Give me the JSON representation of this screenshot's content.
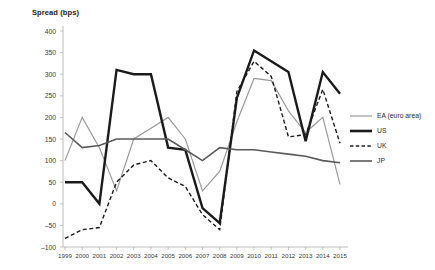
{
  "chart_data": {
    "type": "line",
    "title": "Spread (bps)",
    "xlabel": "",
    "ylabel": "Spread (bps)",
    "ylim": [
      -100,
      400
    ],
    "ytick_step": 50,
    "yticks": [
      400,
      350,
      300,
      250,
      200,
      150,
      100,
      50,
      0,
      -50,
      -100
    ],
    "grid": false,
    "legend_position": "right",
    "x": [
      1999,
      2000,
      2001,
      2002,
      2003,
      2004,
      2005,
      2006,
      2007,
      2008,
      2009,
      2010,
      2011,
      2012,
      2013,
      2014,
      2015
    ],
    "categories": [
      "1999",
      "2000",
      "2001",
      "2002",
      "2003",
      "2004",
      "2005",
      "2006",
      "2007",
      "2008",
      "2009",
      "2010",
      "2011",
      "2012",
      "2013",
      "2014",
      "2015"
    ],
    "series": [
      {
        "name": "EA (euro area)",
        "color": "#9a9a9a",
        "style": "solid",
        "width": 1.2,
        "values": [
          100,
          200,
          130,
          30,
          150,
          175,
          200,
          150,
          30,
          75,
          190,
          290,
          285,
          215,
          165,
          200,
          45
        ]
      },
      {
        "name": "US",
        "color": "#1a1a1a",
        "style": "solid",
        "width": 2.4,
        "values": [
          50,
          50,
          0,
          310,
          300,
          300,
          130,
          125,
          -10,
          -45,
          245,
          355,
          330,
          305,
          145,
          305,
          255
        ]
      },
      {
        "name": "UK",
        "color": "#1a1a1a",
        "style": "dashed",
        "width": 1.4,
        "values": [
          -80,
          -60,
          -55,
          50,
          90,
          100,
          60,
          40,
          -25,
          -60,
          260,
          330,
          295,
          155,
          160,
          265,
          140
        ]
      },
      {
        "name": "JP",
        "color": "#595959",
        "style": "solid",
        "width": 1.6,
        "values": [
          165,
          130,
          135,
          150,
          150,
          150,
          150,
          125,
          100,
          130,
          125,
          125,
          120,
          115,
          110,
          100,
          95
        ]
      }
    ],
    "legend_entries": [
      {
        "label": "EA (euro area)",
        "color": "#9a9a9a",
        "style": "solid",
        "width": 1.2,
        "icon": "line-swatch-solid-light"
      },
      {
        "label": "US",
        "color": "#1a1a1a",
        "style": "solid",
        "width": 2.6,
        "icon": "line-swatch-solid-bold"
      },
      {
        "label": "UK",
        "color": "#1a1a1a",
        "style": "dashed",
        "width": 1.4,
        "icon": "line-swatch-dashed"
      },
      {
        "label": "JP",
        "color": "#595959",
        "style": "solid",
        "width": 1.6,
        "icon": "line-swatch-solid-medium"
      }
    ],
    "axis_colors": {
      "axis_line": "#b5b5b5",
      "tick_text": "#3a3a3a",
      "title_text": "#1a1a1a"
    }
  }
}
